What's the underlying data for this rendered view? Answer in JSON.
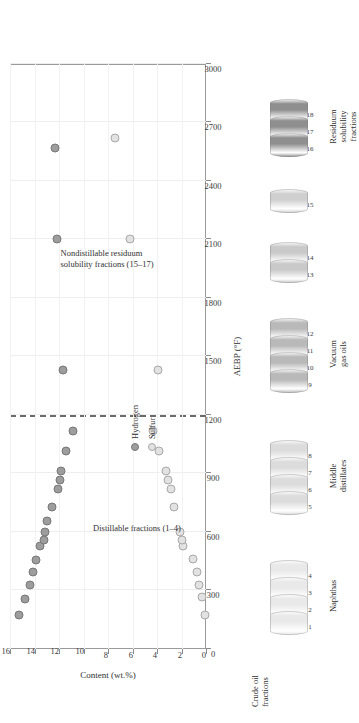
{
  "figure": {
    "title": "",
    "axis_note": ""
  },
  "chart_data": {
    "type": "scatter",
    "title": "",
    "xlabel": "AEBP (°F)",
    "ylabel": "Content (wt.%)",
    "xlim": [
      0,
      3000
    ],
    "ylim": [
      0,
      16
    ],
    "xticks": [
      0,
      300,
      600,
      900,
      1200,
      1500,
      1800,
      2100,
      2400,
      2700,
      3000
    ],
    "yticks": [
      0,
      2,
      4,
      6,
      8,
      10,
      12,
      14,
      16
    ],
    "grid": true,
    "legend_position": "inside-center",
    "annotations": [
      {
        "text": "Distillable fractions (1–4)",
        "x": 620,
        "y": 5.6
      },
      {
        "text": "Nondistillable residuum",
        "x": 2000,
        "y": 8.1
      },
      {
        "text": "solubility fractions (15–17)",
        "x": 2000,
        "y": 7.3
      },
      {
        "text": "dashed-divider-at-1200",
        "x": 1200,
        "y": 16
      }
    ],
    "series": [
      {
        "name": "Hydrogen",
        "color": "#9d9d9d",
        "marker": "filled-circle",
        "points": [
          {
            "x": 175,
            "y": 15.25
          },
          {
            "x": 255,
            "y": 14.75
          },
          {
            "x": 330,
            "y": 14.35
          },
          {
            "x": 395,
            "y": 14.15
          },
          {
            "x": 455,
            "y": 13.85
          },
          {
            "x": 530,
            "y": 13.55
          },
          {
            "x": 560,
            "y": 13.25
          },
          {
            "x": 600,
            "y": 13.15
          },
          {
            "x": 655,
            "y": 12.95
          },
          {
            "x": 730,
            "y": 12.55
          },
          {
            "x": 820,
            "y": 12.05
          },
          {
            "x": 865,
            "y": 11.95
          },
          {
            "x": 915,
            "y": 11.85
          },
          {
            "x": 1015,
            "y": 11.45
          },
          {
            "x": 1120,
            "y": 10.85
          },
          {
            "x": 1430,
            "y": 11.7
          },
          {
            "x": 2100,
            "y": 12.15
          },
          {
            "x": 2570,
            "y": 12.3
          }
        ]
      },
      {
        "name": "Sulfur",
        "color": "#e2e2e2",
        "marker": "open-circle",
        "points": [
          {
            "x": 175,
            "y": 0.05
          },
          {
            "x": 265,
            "y": 0.35
          },
          {
            "x": 330,
            "y": 0.55
          },
          {
            "x": 395,
            "y": 0.7
          },
          {
            "x": 460,
            "y": 1.05
          },
          {
            "x": 530,
            "y": 1.85
          },
          {
            "x": 560,
            "y": 1.95
          },
          {
            "x": 600,
            "y": 2.1
          },
          {
            "x": 730,
            "y": 2.65
          },
          {
            "x": 820,
            "y": 2.85
          },
          {
            "x": 865,
            "y": 3.1
          },
          {
            "x": 915,
            "y": 3.25
          },
          {
            "x": 1015,
            "y": 3.85
          },
          {
            "x": 1120,
            "y": 4.3
          },
          {
            "x": 1430,
            "y": 3.95
          },
          {
            "x": 2100,
            "y": 6.2
          },
          {
            "x": 2620,
            "y": 7.45
          }
        ]
      }
    ]
  },
  "legend": {
    "items": [
      {
        "label": "Hydrogen",
        "marker": "filled-circle",
        "color": "#9d9d9d"
      },
      {
        "label": "Sulfur",
        "marker": "open-circle",
        "color": "#e2e2e2"
      }
    ]
  },
  "barrels": {
    "header": [
      "Crude oil",
      "fractions"
    ],
    "groups": [
      {
        "label": "Naphthas",
        "numbers": [
          "1",
          "2",
          "3",
          "4"
        ],
        "shade": "#e9e9e9"
      },
      {
        "label": "Middle\ndistillates",
        "numbers": [
          "5",
          "6",
          "7",
          "8"
        ],
        "shade": "#dcdcdc"
      },
      {
        "label": "Vacuum\ngas oils",
        "numbers": [
          "9",
          "10",
          "11",
          "12"
        ],
        "shade": "#b9b9b9"
      },
      {
        "label": "",
        "numbers": [
          "13",
          "14"
        ],
        "shade": "#c9c9c9"
      },
      {
        "label": "",
        "numbers": [
          "15"
        ],
        "shade": "#cfcfcf"
      },
      {
        "label": "Residuum\nsolubility\nfractions",
        "numbers": [
          "16",
          "17",
          "18"
        ],
        "shade": "#8f8f8f"
      }
    ]
  }
}
